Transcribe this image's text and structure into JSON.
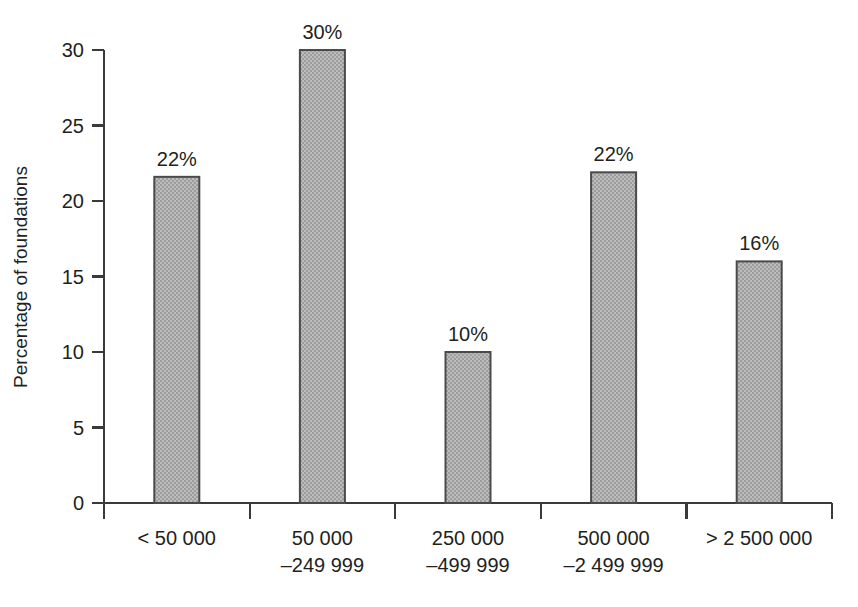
{
  "chart_data": {
    "type": "bar",
    "title": "",
    "subtitle": "",
    "xlabel": "",
    "ylabel": "Percentage of foundations",
    "categories": [
      "< 50 000",
      "50 000\n–249 999",
      "250 000\n–499 999",
      "500 000\n–2 499 999",
      "> 2 500 000"
    ],
    "category_lines": [
      [
        "< 50 000"
      ],
      [
        "50 000",
        "–249 999"
      ],
      [
        "250 000",
        "–499 999"
      ],
      [
        "500 000",
        "–2 499 999"
      ],
      [
        "> 2 500 000"
      ]
    ],
    "values": [
      21.6,
      30.0,
      10.0,
      21.9,
      16.0
    ],
    "data_labels": [
      "22%",
      "30%",
      "10%",
      "22%",
      "16%"
    ],
    "ylim": [
      0,
      30
    ],
    "ytick_values": [
      0,
      5,
      10,
      15,
      20,
      25,
      30
    ],
    "ytick_labels": [
      "0",
      "5",
      "10",
      "15",
      "20",
      "25",
      "30"
    ],
    "grid": false,
    "legend": null,
    "legend_position": "none",
    "bar_fill_color": "#adadad",
    "bar_edge_color": "#4a4a4a",
    "axis_color": "#3a3a3a",
    "background_color": "#ffffff",
    "text_color": "#231f20"
  },
  "axis": {
    "y_title": "Percentage of foundations"
  }
}
